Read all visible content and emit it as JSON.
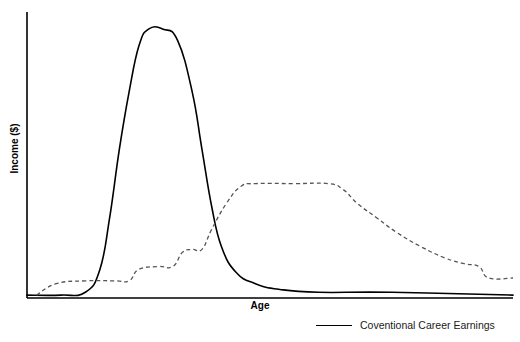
{
  "chart_data": {
    "type": "line",
    "title": "",
    "xlabel": "Age",
    "ylabel": "Income ($)",
    "xlim": [
      0,
      100
    ],
    "ylim": [
      0,
      100
    ],
    "grid": false,
    "axes": {
      "show_x": true,
      "show_y": true,
      "ticks": false,
      "tick_labels": false
    },
    "legend": {
      "position": "bottom-right",
      "entries": [
        {
          "name": "Coventional Career Earnings",
          "style": "solid",
          "color": "#000000"
        }
      ]
    },
    "annotations": [],
    "series": [
      {
        "name": "Coventional Career Earnings",
        "style": "solid",
        "color": "#000000",
        "points": [
          {
            "x": 0,
            "y": 1
          },
          {
            "x": 7,
            "y": 1
          },
          {
            "x": 12,
            "y": 2
          },
          {
            "x": 15,
            "y": 10
          },
          {
            "x": 17,
            "y": 28
          },
          {
            "x": 19,
            "y": 52
          },
          {
            "x": 21,
            "y": 72
          },
          {
            "x": 23,
            "y": 88
          },
          {
            "x": 25,
            "y": 94
          },
          {
            "x": 28,
            "y": 94
          },
          {
            "x": 31,
            "y": 90
          },
          {
            "x": 34,
            "y": 72
          },
          {
            "x": 36,
            "y": 52
          },
          {
            "x": 38,
            "y": 32
          },
          {
            "x": 40,
            "y": 18
          },
          {
            "x": 43,
            "y": 9
          },
          {
            "x": 47,
            "y": 5
          },
          {
            "x": 52,
            "y": 3
          },
          {
            "x": 60,
            "y": 2
          },
          {
            "x": 75,
            "y": 2
          },
          {
            "x": 100,
            "y": 1
          }
        ]
      },
      {
        "name": "Alternative Earnings",
        "style": "dashed",
        "color": "#555555",
        "points": [
          {
            "x": 2,
            "y": 1
          },
          {
            "x": 6,
            "y": 5
          },
          {
            "x": 12,
            "y": 6
          },
          {
            "x": 18,
            "y": 6
          },
          {
            "x": 21,
            "y": 6
          },
          {
            "x": 23,
            "y": 10
          },
          {
            "x": 27,
            "y": 11
          },
          {
            "x": 30,
            "y": 11
          },
          {
            "x": 32,
            "y": 16
          },
          {
            "x": 34,
            "y": 17
          },
          {
            "x": 36,
            "y": 17
          },
          {
            "x": 38,
            "y": 24
          },
          {
            "x": 41,
            "y": 33
          },
          {
            "x": 44,
            "y": 39
          },
          {
            "x": 47,
            "y": 40
          },
          {
            "x": 55,
            "y": 40
          },
          {
            "x": 62,
            "y": 40
          },
          {
            "x": 65,
            "y": 38
          },
          {
            "x": 68,
            "y": 33
          },
          {
            "x": 72,
            "y": 28
          },
          {
            "x": 76,
            "y": 23
          },
          {
            "x": 81,
            "y": 18
          },
          {
            "x": 86,
            "y": 14
          },
          {
            "x": 90,
            "y": 12
          },
          {
            "x": 93,
            "y": 11
          },
          {
            "x": 95,
            "y": 7
          },
          {
            "x": 100,
            "y": 7
          }
        ]
      }
    ]
  }
}
